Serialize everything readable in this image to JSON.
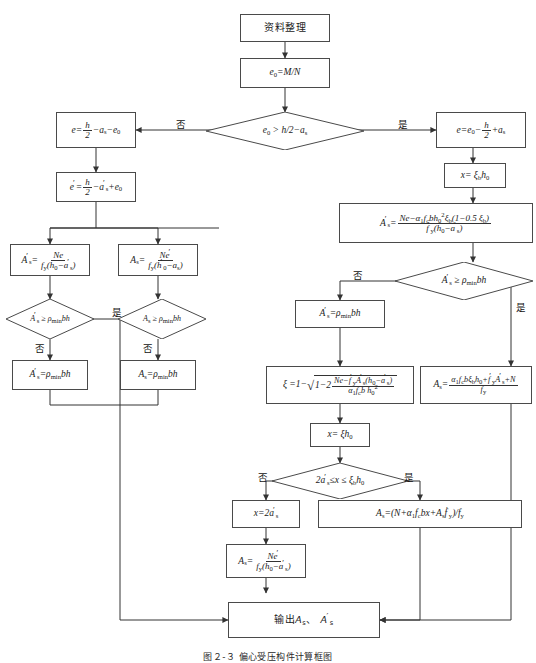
{
  "diagram": {
    "type": "flowchart",
    "caption": "图２-３  偏心受压构件计算框图",
    "yes_label": "是",
    "no_label": "否",
    "nodes": {
      "start": "资料整理",
      "e0": "e₀=M/N",
      "decision_e0": "e₀ > h/2−aₛ",
      "left_e": "e = h/2 − aₛ − e₀",
      "left_e_prime": "e′ = h/2 − a′ₛ + e₀",
      "right_e": "e = e₀ − h/2 + aₛ",
      "right_x": "x = ξ_b h₀",
      "right_As_prime": "A′ₛ = [Ne − α₁ f_c b h₀² ξ_b (1−0.5ξ_b)] / [f′_y (h₀ − a′ₛ)]",
      "left_As_prime_Ne": "A′ₛ = Ne / [f_y (h₀ − a′ₛ)]",
      "left_As_Ne_prime": "Aₛ = Ne′ / [f_y (h′₀ − aₛ)]",
      "decision_Asp_rho": "A′ₛ ≧ ρ_min bh",
      "decision_As_rho": "Aₛ ≧ ρ_min bh",
      "set_Asp_rho": "A′ₛ = ρ_min bh",
      "set_As_rho": "Aₛ = ρ_min bh",
      "decision_Asp_rho_right": "A′ₛ ≧ ρ_min bh",
      "set_Asp_rho_right": "A′ₛ = ρ_min bh",
      "xi_formula": "ξ = 1 − √[1 − 2 (Ne − f′_y A′ₛ (h₀ − a′ₛ)) / (α₁ f_c b h₀²)]",
      "As_big": "Aₛ = (α₁ f_c b ξ_b h₀ + f′_y A′ₛ + N) / f_y",
      "x_xi_h0": "x = ξ h₀",
      "decision_x_range": "2a′ₛ ≦ x ≦ ξ_b h₀",
      "x_2asp": "x = 2a′ₛ",
      "As_Ne_prime2": "Aₛ = Ne′ / [f_y (h₀ − a′ₛ)]",
      "As_combined": "Aₛ = (N + α₁ f_c bx + Aₛ f′_y)/f_y",
      "output": "输出Aₛ、A′ₛ"
    },
    "colors": {
      "stroke": "#4a4a4a",
      "line": "#333333",
      "background": "#ffffff",
      "text": "#1a1a1a"
    }
  }
}
